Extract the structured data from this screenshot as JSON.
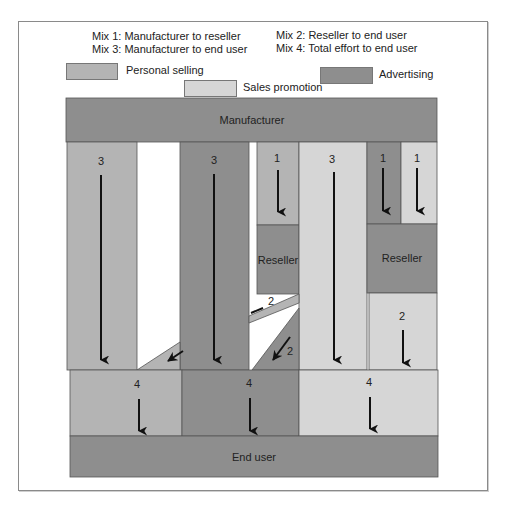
{
  "mixes": [
    {
      "id": 1,
      "label": "Mix 1: Manufacturer to reseller"
    },
    {
      "id": 2,
      "label": "Mix 2: Reseller to end user"
    },
    {
      "id": 3,
      "label": "Mix 3: Manufacturer to end user"
    },
    {
      "id": 4,
      "label": "Mix 4: Total effort to end user"
    }
  ],
  "legend": {
    "personal_selling": {
      "label": "Personal selling",
      "color": "#b4b4b4"
    },
    "sales_promotion": {
      "label": "Sales promotion",
      "color": "#d6d6d6"
    },
    "advertising": {
      "label": "Advertising",
      "color": "#8e8e8e"
    }
  },
  "nodes": {
    "manufacturer": "Manufacturer",
    "reseller_left": "Reseller",
    "reseller_right": "Reseller",
    "end_user": "End user"
  },
  "flow_labels": {
    "col1_mix": "3",
    "col2_mix": "3",
    "col3_mix": "1",
    "col4_mix": "3",
    "col5_mix": "1",
    "col6_mix": "1",
    "reseller_left_upper_mix": "2",
    "reseller_left_lower_mix": "2",
    "reseller_right_mix": "2",
    "total_left_mix": "4",
    "total_mid_mix": "4",
    "total_right_mix": "4"
  }
}
